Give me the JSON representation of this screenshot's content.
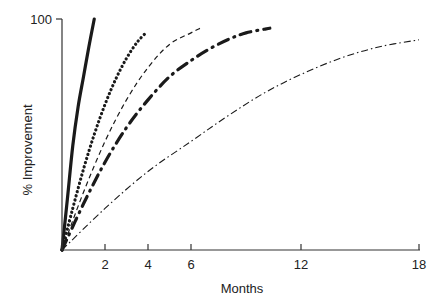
{
  "chart_data": {
    "type": "line",
    "title": "",
    "xlabel": "Months",
    "ylabel": "% Improvement",
    "xlim": [
      0,
      18
    ],
    "ylim": [
      0,
      100
    ],
    "x_ticks": [
      2,
      4,
      6,
      12,
      18
    ],
    "y_ticks": [
      100
    ],
    "grid": false,
    "legend": null,
    "series": [
      {
        "name": "solid",
        "style": "solid-thick",
        "x": [
          0,
          0.25,
          0.5,
          0.75,
          1.0,
          1.25,
          1.5
        ],
        "y": [
          0,
          22,
          45,
          62,
          75,
          88,
          100
        ]
      },
      {
        "name": "dotted",
        "style": "dotted-thick",
        "x": [
          0,
          0.5,
          1.0,
          1.5,
          2.0,
          2.5,
          3.0,
          3.5,
          3.9
        ],
        "y": [
          0,
          18,
          35,
          50,
          63,
          74,
          83,
          90,
          94
        ]
      },
      {
        "name": "dashed",
        "style": "dashed-thin",
        "x": [
          0,
          1,
          2,
          3,
          4,
          5,
          6,
          6.5
        ],
        "y": [
          0,
          25,
          47,
          65,
          79,
          89,
          94,
          96
        ]
      },
      {
        "name": "dash-dot-heavy",
        "style": "dash-dot-thick",
        "x": [
          0,
          1,
          2,
          3,
          4,
          5,
          6,
          7,
          8,
          9,
          10.3
        ],
        "y": [
          0,
          20,
          38,
          53,
          65,
          75,
          82,
          87,
          91,
          94,
          96
        ]
      },
      {
        "name": "dash-dot-thin",
        "style": "dash-dot-thin",
        "x": [
          0,
          2,
          4,
          6,
          8,
          10,
          12,
          14,
          16,
          18
        ],
        "y": [
          0,
          18,
          34,
          47,
          58,
          68,
          76,
          83,
          88,
          91
        ]
      }
    ]
  },
  "labels": {
    "y_top": "100",
    "x_ticks": [
      "2",
      "4",
      "6",
      "12",
      "18"
    ],
    "xlabel": "Months",
    "ylabel": "% Improvement"
  }
}
